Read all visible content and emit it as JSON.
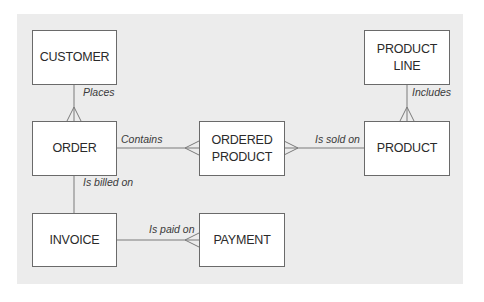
{
  "diagram": {
    "type": "entity-relationship",
    "colors": {
      "panel": "#ececec",
      "box_fill": "#ffffff",
      "box_border": "#6a6a6a",
      "line": "#7a7a7a",
      "text": "#2a2a2a"
    },
    "entities": [
      {
        "id": "customer",
        "label": "CUSTOMER"
      },
      {
        "id": "order",
        "label": "ORDER"
      },
      {
        "id": "ordered_product",
        "label": "ORDERED\nPRODUCT"
      },
      {
        "id": "product",
        "label": "PRODUCT"
      },
      {
        "id": "product_line",
        "label": "PRODUCT\nLINE"
      },
      {
        "id": "invoice",
        "label": "INVOICE"
      },
      {
        "id": "payment",
        "label": "PAYMENT"
      }
    ],
    "relationships": [
      {
        "from": "CUSTOMER",
        "to": "ORDER",
        "label": "Places",
        "many_end": "ORDER"
      },
      {
        "from": "ORDER",
        "to": "ORDERED PRODUCT",
        "label": "Contains",
        "many_end": "ORDERED PRODUCT"
      },
      {
        "from": "PRODUCT",
        "to": "ORDERED PRODUCT",
        "label": "Is sold on",
        "many_end": "ORDERED PRODUCT"
      },
      {
        "from": "PRODUCT LINE",
        "to": "PRODUCT",
        "label": "Includes",
        "many_end": "PRODUCT"
      },
      {
        "from": "ORDER",
        "to": "INVOICE",
        "label": "Is billed on",
        "many_end": "none"
      },
      {
        "from": "INVOICE",
        "to": "PAYMENT",
        "label": "Is paid on",
        "many_end": "PAYMENT"
      }
    ]
  }
}
